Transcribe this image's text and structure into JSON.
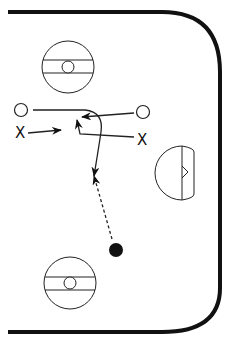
{
  "diagram": {
    "colors": {
      "ink": "#111111",
      "background": "#ffffff"
    },
    "players": {
      "offense": [
        {
          "id": "O1",
          "symbol": "circle",
          "side": "left"
        },
        {
          "id": "O2",
          "symbol": "circle",
          "side": "right"
        }
      ],
      "defense": [
        {
          "id": "X1",
          "label": "X",
          "side": "left"
        },
        {
          "id": "X2",
          "label": "X",
          "side": "right"
        }
      ]
    },
    "puck": {
      "label": "puck"
    },
    "elements": [
      "rink-boards",
      "faceoff-circle-top",
      "faceoff-circle-bottom",
      "goal-crease",
      "goal-net"
    ],
    "paths": [
      {
        "from": "O1",
        "type": "skate",
        "style": "solid",
        "description": "curving skate path down toward slot"
      },
      {
        "from": "O2",
        "type": "skate",
        "style": "solid",
        "description": "skate left toward center"
      },
      {
        "from": "X1",
        "type": "skate",
        "style": "solid",
        "description": "skate right"
      },
      {
        "from": "X2",
        "type": "skate",
        "style": "solid",
        "description": "skate left then up"
      },
      {
        "from": "puck",
        "type": "pass",
        "style": "dashed",
        "description": "pass up to slot"
      }
    ]
  }
}
